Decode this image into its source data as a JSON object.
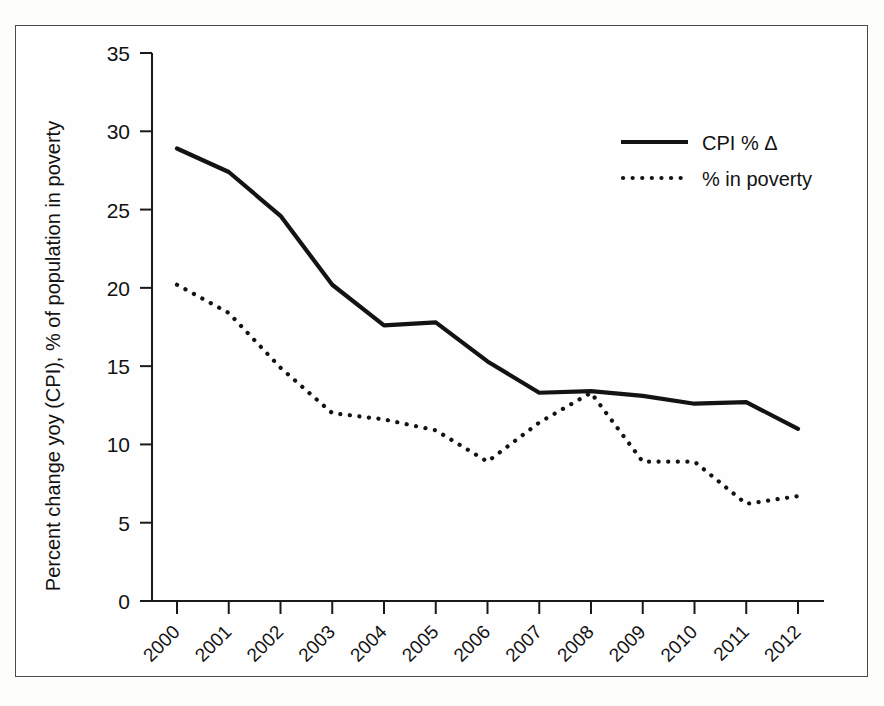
{
  "figure": {
    "background_color": "#fefefe",
    "border_color": "#4a4a4a",
    "line_color": "#131313"
  },
  "chart_data": {
    "type": "line",
    "title": "",
    "xlabel": "",
    "ylabel": "Percent change yoy (CPI), % of population in poverty",
    "categories": [
      "2000",
      "2001",
      "2002",
      "2003",
      "2004",
      "2005",
      "2006",
      "2007",
      "2008",
      "2009",
      "2010",
      "2011",
      "2012"
    ],
    "x": [
      2000,
      2001,
      2002,
      2003,
      2004,
      2005,
      2006,
      2007,
      2008,
      2009,
      2010,
      2011,
      2012
    ],
    "series": [
      {
        "name": "CPI % Δ",
        "style": "solid",
        "values": [
          28.9,
          27.4,
          24.6,
          20.2,
          17.6,
          17.8,
          15.3,
          13.3,
          13.4,
          13.1,
          12.6,
          12.7,
          11.0
        ]
      },
      {
        "name": "% in poverty",
        "style": "dotted",
        "values": [
          20.2,
          18.4,
          14.9,
          12.0,
          11.6,
          10.9,
          8.9,
          11.4,
          13.3,
          8.9,
          8.9,
          6.2,
          6.7
        ]
      }
    ],
    "ylim": [
      0,
      35
    ],
    "yticks": [
      0,
      5,
      10,
      15,
      20,
      25,
      30,
      35
    ],
    "ytick_labels": [
      "0",
      "5",
      "10",
      "15",
      "20",
      "25",
      "30",
      "35"
    ],
    "grid": false,
    "legend_position": "top-right",
    "legend_entries": [
      {
        "label": "CPI % Δ",
        "style": "solid"
      },
      {
        "label": "% in poverty",
        "style": "dotted"
      }
    ],
    "xtick_label_rotation": -45
  }
}
